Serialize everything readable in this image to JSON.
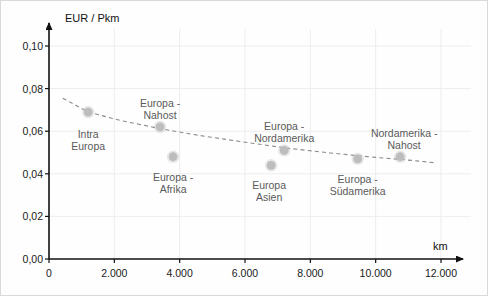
{
  "chart_data": {
    "type": "scatter",
    "title": "",
    "xlabel": "km",
    "ylabel": "EUR / Pkm",
    "xlim": [
      0,
      13000
    ],
    "ylim": [
      0.0,
      0.11
    ],
    "grid": true,
    "legend": "none",
    "x_ticks": [
      {
        "value": 0,
        "label": "0"
      },
      {
        "value": 2000,
        "label": "2.000"
      },
      {
        "value": 4000,
        "label": "4.000"
      },
      {
        "value": 6000,
        "label": "6.000"
      },
      {
        "value": 8000,
        "label": "8.000"
      },
      {
        "value": 10000,
        "label": "10.000"
      },
      {
        "value": 12000,
        "label": "12.000"
      }
    ],
    "y_ticks": [
      {
        "value": 0.0,
        "label": "0,00"
      },
      {
        "value": 0.02,
        "label": "0,02"
      },
      {
        "value": 0.04,
        "label": "0,04"
      },
      {
        "value": 0.06,
        "label": "0,06"
      },
      {
        "value": 0.08,
        "label": "0,08"
      },
      {
        "value": 0.1,
        "label": "0,10"
      }
    ],
    "marker_color": "#bdbdbd",
    "trend_color": "#8a8a8a",
    "points": [
      {
        "label": "Intra\nEuropa",
        "x": 1200,
        "y": 0.069,
        "label_dx": 0,
        "label_dy": 16,
        "label_align": "center"
      },
      {
        "label": "Europa -\nNahost",
        "x": 3400,
        "y": 0.062,
        "label_dx": 0,
        "label_dy": -30,
        "label_align": "center"
      },
      {
        "label": "Europa -\nAfrika",
        "x": 3800,
        "y": 0.048,
        "label_dx": 0,
        "label_dy": 14,
        "label_align": "center"
      },
      {
        "label": "Europa\nAsien",
        "x": 6800,
        "y": 0.044,
        "label_dx": -2,
        "label_dy": 14,
        "label_align": "center"
      },
      {
        "label": "Europa -\nNordamerika",
        "x": 7200,
        "y": 0.051,
        "label_dx": 0,
        "label_dy": -30,
        "label_align": "center"
      },
      {
        "label": "Europa -\nSüdamerika",
        "x": 9450,
        "y": 0.047,
        "label_dx": 0,
        "label_dy": 14,
        "label_align": "center"
      },
      {
        "label": "Nordamerika -\nNahost",
        "x": 10750,
        "y": 0.048,
        "label_dx": 4,
        "label_dy": -30,
        "label_align": "center"
      }
    ],
    "trend_line": {
      "style": "dashed",
      "points": [
        {
          "x": 420,
          "y": 0.0755
        },
        {
          "x": 1200,
          "y": 0.069
        },
        {
          "x": 2200,
          "y": 0.065
        },
        {
          "x": 3400,
          "y": 0.0612
        },
        {
          "x": 4600,
          "y": 0.058
        },
        {
          "x": 5800,
          "y": 0.0553
        },
        {
          "x": 7200,
          "y": 0.0522
        },
        {
          "x": 8600,
          "y": 0.0498
        },
        {
          "x": 10000,
          "y": 0.0477
        },
        {
          "x": 11100,
          "y": 0.0463
        },
        {
          "x": 11800,
          "y": 0.0452
        }
      ]
    }
  }
}
